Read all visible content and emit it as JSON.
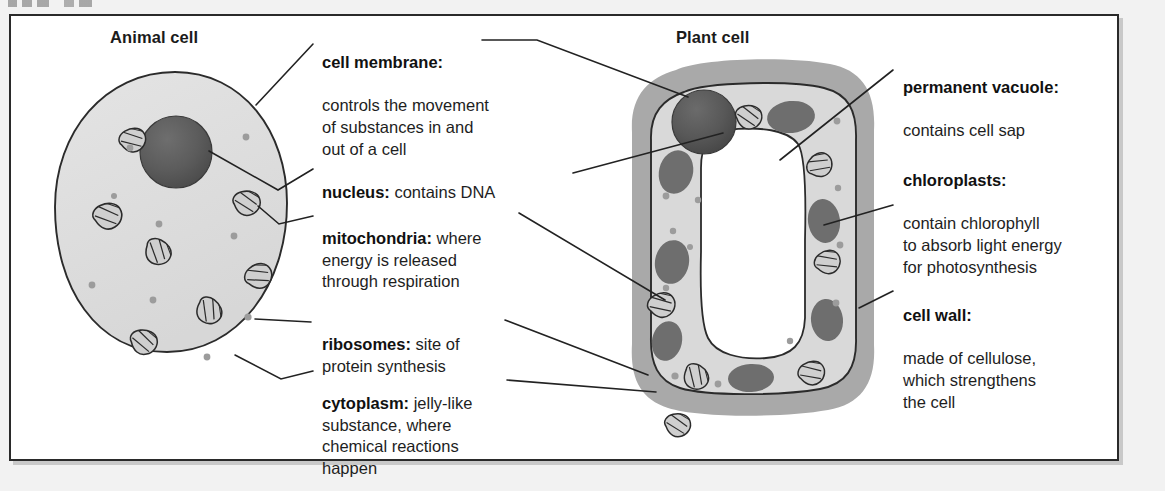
{
  "figure": {
    "panels": [
      {
        "id": "animal",
        "title": "Animal cell"
      },
      {
        "id": "plant",
        "title": "Plant cell"
      }
    ]
  },
  "labels": [
    {
      "id": "cell-membrane",
      "term": "cell membrane:",
      "description": "controls the movement\nof substances in and\nout of a cell"
    },
    {
      "id": "nucleus",
      "term": "nucleus:",
      "description": " contains DNA"
    },
    {
      "id": "mitochondria",
      "term": "mitochondria:",
      "description": " where\nenergy is released\nthrough respiration"
    },
    {
      "id": "ribosomes",
      "term": "ribosomes:",
      "description": " site of\nprotein synthesis"
    },
    {
      "id": "cytoplasm",
      "term": "cytoplasm:",
      "description": " jelly-like\nsubstance, where\nchemical reactions\nhappen"
    },
    {
      "id": "permanent-vacuole",
      "term": "permanent vacuole:",
      "description": "contains cell sap"
    },
    {
      "id": "chloroplasts",
      "term": "chloroplasts:",
      "description": "contain chlorophyll\nto absorb light energy\nfor photosynthesis"
    },
    {
      "id": "cell-wall",
      "term": "cell wall:",
      "description": "made of cellulose,\nwhich strengthens\nthe cell"
    }
  ],
  "colors": {
    "frame_border": "#2a2a2a",
    "page_background": "#f2f2f2",
    "panel_background": "#ffffff",
    "cytoplasm": "#dedede",
    "cell_wall": "#a9a9a9",
    "plant_cytoplasm": "#d8d8d8",
    "vacuole": "#ffffff",
    "nucleus": "#585858",
    "chloroplast": "#6e6e6e",
    "mitochondrion_fill": "#cfcfcf",
    "ribosome": "#9a9a9a",
    "outline": "#2b2b2b",
    "leader_line": "#222222",
    "text": "#1e1e1e"
  },
  "diagram_data": {
    "type": "labelled-biology-diagram",
    "subject": "Comparison of animal and plant cell structure",
    "animal_cell": {
      "shape": "oval",
      "structures": [
        "cell membrane",
        "nucleus",
        "mitochondria",
        "ribosomes",
        "cytoplasm"
      ],
      "mitochondria_count": 7,
      "ribosome_count": 9,
      "nucleus_count": 1
    },
    "plant_cell": {
      "shape": "rounded rectangle",
      "structures": [
        "cell wall",
        "cell membrane",
        "nucleus",
        "mitochondria",
        "ribosomes",
        "cytoplasm",
        "permanent vacuole",
        "chloroplasts"
      ],
      "mitochondria_count": 7,
      "chloroplast_count": 7,
      "ribosome_count": 12,
      "nucleus_count": 1
    },
    "shared_structures": [
      "cell membrane",
      "nucleus",
      "mitochondria",
      "ribosomes",
      "cytoplasm"
    ],
    "plant_only_structures": [
      "cell wall",
      "permanent vacuole",
      "chloroplasts"
    ]
  }
}
